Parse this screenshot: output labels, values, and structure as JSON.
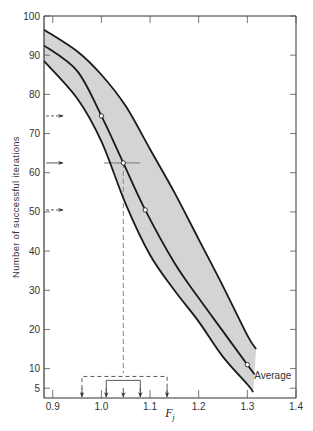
{
  "chart_data": {
    "type": "line",
    "title": "",
    "xlabel": "F",
    "xlabel_subscript": "j",
    "ylabel": "Number of successful iterations",
    "xlim": [
      0.882,
      1.4
    ],
    "ylim": [
      2.5,
      100
    ],
    "x_ticks": [
      0.9,
      1.0,
      1.1,
      1.2,
      1.3,
      1.4
    ],
    "x_tick_labels": [
      "0.9",
      "1.0",
      "1.1",
      "1.2",
      "1.3",
      "1.4"
    ],
    "y_ticks": [
      5,
      10,
      20,
      30,
      40,
      50,
      60,
      70,
      80,
      90,
      100
    ],
    "y_tick_labels": [
      "5",
      "10",
      "20",
      "30",
      "40",
      "50",
      "60",
      "70",
      "80",
      "90",
      "100"
    ],
    "grid": false,
    "band_color": "#d4d4d4",
    "line_color": "#1a1a1a",
    "series": [
      {
        "name": "Upper bound",
        "x": [
          0.882,
          0.95,
          1.0,
          1.05,
          1.1,
          1.15,
          1.2,
          1.25,
          1.3,
          1.318
        ],
        "y": [
          96.5,
          91,
          85,
          77,
          66,
          55,
          43,
          31,
          18.5,
          15
        ]
      },
      {
        "name": "Average",
        "x": [
          0.882,
          0.95,
          1.0,
          1.045,
          1.09,
          1.15,
          1.2,
          1.25,
          1.3,
          1.315
        ],
        "y": [
          92.5,
          86,
          74.5,
          62.5,
          50.5,
          37,
          28,
          19.5,
          11,
          8.5
        ]
      },
      {
        "name": "Lower bound",
        "x": [
          0.882,
          0.95,
          1.0,
          1.05,
          1.1,
          1.15,
          1.2,
          1.25,
          1.3,
          1.312
        ],
        "y": [
          88.5,
          79,
          68,
          52,
          39,
          30,
          22,
          13,
          6,
          4
        ]
      }
    ],
    "marked_points": [
      {
        "x": 1.0,
        "y": 74.5
      },
      {
        "x": 1.045,
        "y": 62.5
      },
      {
        "x": 1.09,
        "y": 50.5
      },
      {
        "x": 1.3,
        "y": 11
      }
    ],
    "y_arrows": [
      {
        "y": 74.5,
        "style": "dashed"
      },
      {
        "y": 62.5,
        "style": "solid"
      },
      {
        "y": 50.5,
        "style": "dashed"
      }
    ],
    "reference_lines": {
      "horizontal": {
        "y": 62.5,
        "x_from": 1.005,
        "x_to": 1.08
      },
      "vertical": {
        "x": 1.045,
        "y_from": 62.5,
        "y_to": 8.8,
        "style": "dashed"
      }
    },
    "brackets": [
      {
        "style": "dashed",
        "level": 8,
        "x_from": 0.96,
        "x_to": 1.135
      },
      {
        "style": "solid",
        "level": 7,
        "x_from": 1.01,
        "x_to": 1.08
      }
    ],
    "bottom_arrows_x": [
      0.96,
      1.01,
      1.045,
      1.08,
      1.135
    ],
    "annotations": [
      {
        "text": "Average",
        "x": 1.31,
        "y": 8.2
      }
    ]
  }
}
